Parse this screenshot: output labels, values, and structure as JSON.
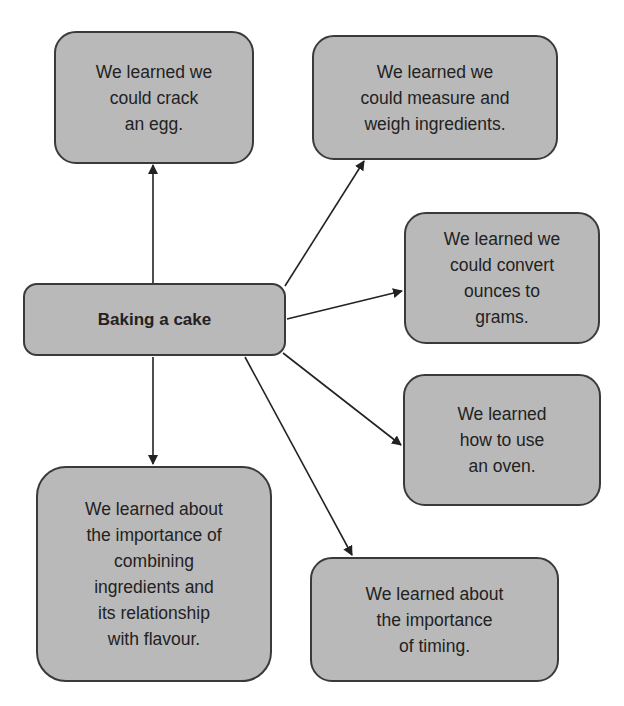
{
  "diagram": {
    "center": {
      "label": "Baking a cake"
    },
    "nodes": [
      {
        "id": "egg",
        "label": "We learned we\ncould crack\nan egg."
      },
      {
        "id": "measure",
        "label": "We learned we\ncould measure and\nweigh ingredients."
      },
      {
        "id": "convert",
        "label": "We learned we\ncould convert\nounces to\ngrams."
      },
      {
        "id": "oven",
        "label": "We learned\nhow to use\nan oven."
      },
      {
        "id": "combine",
        "label": "We learned about\nthe importance of\ncombining\ningredients and\nits relationship\nwith flavour."
      },
      {
        "id": "timing",
        "label": "We learned about\nthe importance\nof timing."
      }
    ],
    "edges": [
      {
        "from": "center",
        "to": "egg"
      },
      {
        "from": "center",
        "to": "measure"
      },
      {
        "from": "center",
        "to": "convert"
      },
      {
        "from": "center",
        "to": "oven"
      },
      {
        "from": "center",
        "to": "combine"
      },
      {
        "from": "center",
        "to": "timing"
      }
    ],
    "colors": {
      "node_fill": "#b9b9b9",
      "border": "#3a3a3a",
      "text": "#222222"
    }
  }
}
